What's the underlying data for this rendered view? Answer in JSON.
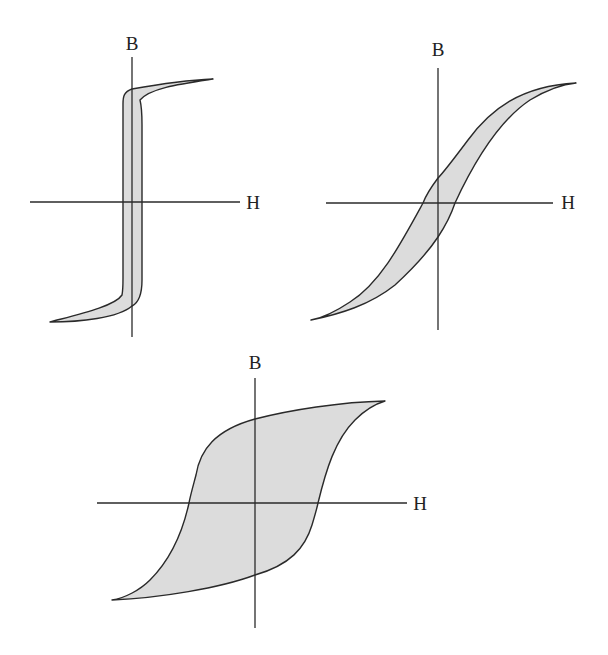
{
  "figure": {
    "colors": {
      "fill": "#dcdcdc",
      "stroke": "#2a2a2a",
      "text": "#222222"
    },
    "loops": [
      {
        "id": "narrow-square-loop",
        "axis_labels": {
          "y": "B",
          "x": "H"
        },
        "y_label_pos": [
          132,
          50
        ],
        "x_label_pos": [
          253,
          209
        ],
        "v_axis": [
          132,
          57,
          132,
          337
        ],
        "h_axis": [
          30,
          202,
          240,
          202
        ],
        "path": "M 213 79 C 180 84, 150 88, 140 100 C 142 108, 142 116, 142 125 L 142 280 C 142 292, 140 302, 132 306 C 118 318, 80 322, 50 322 C 80 314, 115 306, 122 295 C 123 290, 123 285, 123 278 L 123 104 C 123 96, 124 92, 132 89 C 160 84, 190 80, 213 79 Z"
      },
      {
        "id": "soft-s-loop",
        "axis_labels": {
          "y": "B",
          "x": "H"
        },
        "y_label_pos": [
          438,
          56
        ],
        "x_label_pos": [
          568,
          209
        ],
        "v_axis": [
          438,
          68,
          438,
          330
        ],
        "h_axis": [
          326,
          203,
          553,
          203
        ],
        "path": "M 576 83 C 520 86, 490 110, 468 140 C 450 164, 440 176, 438 178 C 432 186, 426 195, 423 203 C 400 245, 380 283, 350 302 C 335 312, 322 318, 311 320 C 340 314, 370 305, 395 285 C 420 262, 432 246, 438 237 C 446 225, 452 212, 455 203 C 475 160, 500 120, 530 100 C 550 88, 565 84, 576 83 Z"
      },
      {
        "id": "wide-loop",
        "axis_labels": {
          "y": "B",
          "x": "H"
        },
        "y_label_pos": [
          255,
          369
        ],
        "x_label_pos": [
          420,
          510
        ],
        "v_axis": [
          255,
          378,
          255,
          628
        ],
        "h_axis": [
          97,
          503,
          407,
          503
        ],
        "path": "M 385 401 C 340 402, 290 410, 255 419 C 215 430, 200 450, 196 475 C 192 490, 190 497, 189 503 C 182 535, 170 560, 150 580 C 140 590, 125 598, 112 600 C 160 598, 220 588, 255 575 C 290 565, 305 548, 312 525 C 315 515, 317 508, 318 503 C 326 470, 335 440, 355 420 C 365 410, 375 404, 385 401 Z"
      }
    ]
  }
}
